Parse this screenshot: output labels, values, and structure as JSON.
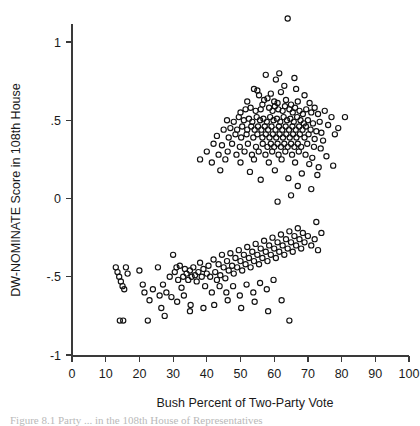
{
  "figure": {
    "caption": "Figure 8.1  Party  ...  in the 108th House of Representatives"
  },
  "chart_data": {
    "type": "scatter",
    "title": "",
    "xlabel": "Bush Percent of Two-Party Vote",
    "ylabel": "DW-NOMINATE Score in 108th House",
    "xlim": [
      0,
      100
    ],
    "ylim": [
      -1.25,
      1.25
    ],
    "xticks": [
      0,
      10,
      20,
      30,
      40,
      50,
      60,
      70,
      80,
      90,
      100
    ],
    "xticklabels": [
      "0",
      "10",
      "20",
      "30",
      "40",
      "50",
      "60",
      "70",
      "80",
      "90",
      "100"
    ],
    "yticks": [
      1,
      0.5,
      0,
      -0.5,
      -1
    ],
    "yticklabels": [
      "1",
      ".5",
      "0",
      "-.5",
      "-1"
    ],
    "grid": false,
    "legend": "none",
    "marker": "open-circle",
    "marker_color": "#111111",
    "marker_radius_px": 2.6,
    "series": [
      {
        "name": "House members",
        "points": [
          [
            64.0,
            1.15
          ],
          [
            57.5,
            0.79
          ],
          [
            60.5,
            0.76
          ],
          [
            61.5,
            0.8
          ],
          [
            66.0,
            0.77
          ],
          [
            63.0,
            0.72
          ],
          [
            54.0,
            0.7
          ],
          [
            55.0,
            0.69
          ],
          [
            55.5,
            0.66
          ],
          [
            59.0,
            0.67
          ],
          [
            62.0,
            0.68
          ],
          [
            66.5,
            0.7
          ],
          [
            69.0,
            0.66
          ],
          [
            52.0,
            0.62
          ],
          [
            57.0,
            0.63
          ],
          [
            58.0,
            0.64
          ],
          [
            60.0,
            0.62
          ],
          [
            61.0,
            0.61
          ],
          [
            63.5,
            0.63
          ],
          [
            65.0,
            0.6
          ],
          [
            67.0,
            0.62
          ],
          [
            70.5,
            0.61
          ],
          [
            72.0,
            0.58
          ],
          [
            50.0,
            0.55
          ],
          [
            51.5,
            0.57
          ],
          [
            53.0,
            0.58
          ],
          [
            54.5,
            0.56
          ],
          [
            56.0,
            0.57
          ],
          [
            56.5,
            0.6
          ],
          [
            58.5,
            0.58
          ],
          [
            59.5,
            0.56
          ],
          [
            60.2,
            0.59
          ],
          [
            61.2,
            0.57
          ],
          [
            62.5,
            0.56
          ],
          [
            63.2,
            0.59
          ],
          [
            64.5,
            0.57
          ],
          [
            65.5,
            0.55
          ],
          [
            66.2,
            0.58
          ],
          [
            67.5,
            0.56
          ],
          [
            68.5,
            0.54
          ],
          [
            69.5,
            0.57
          ],
          [
            71.0,
            0.55
          ],
          [
            73.0,
            0.54
          ],
          [
            75.0,
            0.56
          ],
          [
            77.0,
            0.52
          ],
          [
            81.0,
            0.52
          ],
          [
            46.0,
            0.5
          ],
          [
            48.0,
            0.49
          ],
          [
            49.5,
            0.52
          ],
          [
            51.0,
            0.5
          ],
          [
            52.5,
            0.51
          ],
          [
            53.5,
            0.49
          ],
          [
            54.8,
            0.52
          ],
          [
            55.8,
            0.5
          ],
          [
            56.8,
            0.51
          ],
          [
            57.8,
            0.49
          ],
          [
            58.8,
            0.52
          ],
          [
            59.8,
            0.5
          ],
          [
            60.8,
            0.51
          ],
          [
            61.8,
            0.49
          ],
          [
            62.8,
            0.52
          ],
          [
            63.8,
            0.5
          ],
          [
            64.8,
            0.51
          ],
          [
            65.8,
            0.49
          ],
          [
            66.8,
            0.52
          ],
          [
            67.8,
            0.5
          ],
          [
            68.8,
            0.48
          ],
          [
            70.0,
            0.5
          ],
          [
            71.5,
            0.48
          ],
          [
            73.5,
            0.49
          ],
          [
            76.0,
            0.47
          ],
          [
            79.0,
            0.45
          ],
          [
            45.0,
            0.44
          ],
          [
            47.0,
            0.45
          ],
          [
            49.0,
            0.44
          ],
          [
            50.5,
            0.46
          ],
          [
            52.0,
            0.44
          ],
          [
            53.2,
            0.46
          ],
          [
            54.2,
            0.44
          ],
          [
            55.2,
            0.46
          ],
          [
            56.2,
            0.44
          ],
          [
            57.2,
            0.46
          ],
          [
            58.2,
            0.44
          ],
          [
            59.2,
            0.46
          ],
          [
            60.4,
            0.44
          ],
          [
            61.4,
            0.46
          ],
          [
            62.4,
            0.44
          ],
          [
            63.4,
            0.46
          ],
          [
            64.4,
            0.44
          ],
          [
            65.4,
            0.46
          ],
          [
            66.4,
            0.44
          ],
          [
            67.4,
            0.46
          ],
          [
            68.4,
            0.44
          ],
          [
            69.4,
            0.46
          ],
          [
            70.8,
            0.44
          ],
          [
            72.5,
            0.43
          ],
          [
            74.0,
            0.42
          ],
          [
            78.0,
            0.41
          ],
          [
            43.0,
            0.4
          ],
          [
            46.5,
            0.39
          ],
          [
            48.5,
            0.41
          ],
          [
            50.2,
            0.39
          ],
          [
            51.8,
            0.41
          ],
          [
            53.8,
            0.39
          ],
          [
            55.0,
            0.41
          ],
          [
            56.5,
            0.39
          ],
          [
            57.5,
            0.41
          ],
          [
            58.6,
            0.39
          ],
          [
            59.6,
            0.41
          ],
          [
            60.6,
            0.39
          ],
          [
            61.6,
            0.41
          ],
          [
            62.6,
            0.39
          ],
          [
            63.6,
            0.41
          ],
          [
            64.6,
            0.39
          ],
          [
            65.6,
            0.41
          ],
          [
            66.6,
            0.39
          ],
          [
            67.6,
            0.41
          ],
          [
            69.0,
            0.39
          ],
          [
            70.2,
            0.41
          ],
          [
            72.0,
            0.38
          ],
          [
            74.5,
            0.37
          ],
          [
            42.0,
            0.35
          ],
          [
            44.5,
            0.34
          ],
          [
            47.5,
            0.35
          ],
          [
            49.8,
            0.33
          ],
          [
            52.2,
            0.35
          ],
          [
            54.6,
            0.33
          ],
          [
            56.6,
            0.35
          ],
          [
            58.0,
            0.33
          ],
          [
            59.0,
            0.35
          ],
          [
            60.0,
            0.33
          ],
          [
            61.0,
            0.35
          ],
          [
            62.0,
            0.33
          ],
          [
            63.0,
            0.35
          ],
          [
            64.0,
            0.33
          ],
          [
            65.0,
            0.35
          ],
          [
            66.0,
            0.33
          ],
          [
            67.0,
            0.35
          ],
          [
            68.0,
            0.33
          ],
          [
            69.8,
            0.35
          ],
          [
            71.8,
            0.33
          ],
          [
            73.8,
            0.32
          ],
          [
            40.0,
            0.3
          ],
          [
            43.5,
            0.28
          ],
          [
            46.2,
            0.3
          ],
          [
            48.8,
            0.28
          ],
          [
            51.2,
            0.3
          ],
          [
            53.4,
            0.28
          ],
          [
            55.4,
            0.3
          ],
          [
            57.4,
            0.28
          ],
          [
            59.4,
            0.3
          ],
          [
            61.3,
            0.28
          ],
          [
            63.3,
            0.3
          ],
          [
            65.3,
            0.28
          ],
          [
            67.3,
            0.3
          ],
          [
            69.3,
            0.28
          ],
          [
            71.3,
            0.26
          ],
          [
            75.5,
            0.27
          ],
          [
            38.0,
            0.25
          ],
          [
            41.5,
            0.23
          ],
          [
            45.5,
            0.25
          ],
          [
            50.0,
            0.23
          ],
          [
            54.0,
            0.25
          ],
          [
            58.4,
            0.23
          ],
          [
            62.2,
            0.25
          ],
          [
            66.2,
            0.23
          ],
          [
            70.4,
            0.22
          ],
          [
            73.2,
            0.2
          ],
          [
            77.5,
            0.21
          ],
          [
            44.0,
            0.18
          ],
          [
            52.8,
            0.17
          ],
          [
            60.2,
            0.18
          ],
          [
            68.2,
            0.16
          ],
          [
            72.8,
            0.15
          ],
          [
            56.0,
            0.12
          ],
          [
            64.2,
            0.13
          ],
          [
            67.0,
            0.08
          ],
          [
            71.0,
            0.06
          ],
          [
            65.0,
            0.02
          ],
          [
            61.0,
            -0.02
          ],
          [
            13.0,
            -0.44
          ],
          [
            13.5,
            -0.47
          ],
          [
            14.0,
            -0.5
          ],
          [
            14.5,
            -0.53
          ],
          [
            15.0,
            -0.56
          ],
          [
            15.5,
            -0.58
          ],
          [
            16.0,
            -0.44
          ],
          [
            16.5,
            -0.48
          ],
          [
            14.2,
            -0.78
          ],
          [
            15.2,
            -0.78
          ],
          [
            22.5,
            -0.78
          ],
          [
            20.0,
            -0.46
          ],
          [
            21.0,
            -0.55
          ],
          [
            21.5,
            -0.6
          ],
          [
            23.0,
            -0.65
          ],
          [
            25.5,
            -0.44
          ],
          [
            26.5,
            -0.7
          ],
          [
            27.0,
            -0.55
          ],
          [
            28.0,
            -0.6
          ],
          [
            29.0,
            -0.5
          ],
          [
            30.0,
            -0.36
          ],
          [
            30.5,
            -0.47
          ],
          [
            31.0,
            -0.44
          ],
          [
            31.5,
            -0.52
          ],
          [
            32.0,
            -0.43
          ],
          [
            32.5,
            -0.57
          ],
          [
            33.0,
            -0.5
          ],
          [
            33.5,
            -0.45
          ],
          [
            34.0,
            -0.48
          ],
          [
            34.5,
            -0.52
          ],
          [
            35.0,
            -0.46
          ],
          [
            35.5,
            -0.5
          ],
          [
            36.0,
            -0.44
          ],
          [
            36.5,
            -0.49
          ],
          [
            37.0,
            -0.53
          ],
          [
            37.5,
            -0.47
          ],
          [
            38.0,
            -0.41
          ],
          [
            38.5,
            -0.5
          ],
          [
            39.0,
            -0.45
          ],
          [
            39.5,
            -0.56
          ],
          [
            40.0,
            -0.48
          ],
          [
            40.5,
            -0.43
          ],
          [
            41.0,
            -0.5
          ],
          [
            29.5,
            -0.63
          ],
          [
            31.2,
            -0.66
          ],
          [
            33.2,
            -0.62
          ],
          [
            35.2,
            -0.68
          ],
          [
            26.0,
            -0.62
          ],
          [
            24.0,
            -0.58
          ],
          [
            42.0,
            -0.39
          ],
          [
            42.5,
            -0.47
          ],
          [
            43.0,
            -0.52
          ],
          [
            43.5,
            -0.42
          ],
          [
            44.0,
            -0.49
          ],
          [
            44.5,
            -0.36
          ],
          [
            45.0,
            -0.44
          ],
          [
            45.5,
            -0.51
          ],
          [
            46.0,
            -0.4
          ],
          [
            46.5,
            -0.46
          ],
          [
            47.0,
            -0.35
          ],
          [
            47.5,
            -0.43
          ],
          [
            48.0,
            -0.48
          ],
          [
            48.5,
            -0.38
          ],
          [
            49.0,
            -0.44
          ],
          [
            49.5,
            -0.33
          ],
          [
            50.0,
            -0.4
          ],
          [
            50.5,
            -0.46
          ],
          [
            51.0,
            -0.36
          ],
          [
            51.5,
            -0.42
          ],
          [
            52.0,
            -0.31
          ],
          [
            52.5,
            -0.38
          ],
          [
            53.0,
            -0.44
          ],
          [
            53.5,
            -0.34
          ],
          [
            54.0,
            -0.4
          ],
          [
            54.5,
            -0.29
          ],
          [
            55.0,
            -0.36
          ],
          [
            55.5,
            -0.42
          ],
          [
            56.0,
            -0.32
          ],
          [
            56.5,
            -0.38
          ],
          [
            57.0,
            -0.27
          ],
          [
            57.5,
            -0.34
          ],
          [
            58.0,
            -0.4
          ],
          [
            58.5,
            -0.3
          ],
          [
            59.0,
            -0.36
          ],
          [
            59.5,
            -0.25
          ],
          [
            60.0,
            -0.32
          ],
          [
            60.5,
            -0.38
          ],
          [
            61.0,
            -0.28
          ],
          [
            61.5,
            -0.34
          ],
          [
            62.0,
            -0.23
          ],
          [
            62.5,
            -0.3
          ],
          [
            63.0,
            -0.36
          ],
          [
            63.5,
            -0.26
          ],
          [
            64.0,
            -0.32
          ],
          [
            64.5,
            -0.21
          ],
          [
            65.0,
            -0.28
          ],
          [
            65.5,
            -0.34
          ],
          [
            66.0,
            -0.24
          ],
          [
            66.5,
            -0.3
          ],
          [
            67.0,
            -0.19
          ],
          [
            67.5,
            -0.26
          ],
          [
            68.0,
            -0.32
          ],
          [
            68.5,
            -0.22
          ],
          [
            69.0,
            -0.28
          ],
          [
            70.0,
            -0.24
          ],
          [
            71.0,
            -0.3
          ],
          [
            72.0,
            -0.26
          ],
          [
            73.0,
            -0.33
          ],
          [
            41.5,
            -0.6
          ],
          [
            43.8,
            -0.56
          ],
          [
            45.8,
            -0.6
          ],
          [
            47.8,
            -0.56
          ],
          [
            49.8,
            -0.62
          ],
          [
            51.8,
            -0.55
          ],
          [
            53.8,
            -0.6
          ],
          [
            55.8,
            -0.54
          ],
          [
            57.8,
            -0.58
          ],
          [
            59.8,
            -0.52
          ],
          [
            42.2,
            -0.68
          ],
          [
            46.2,
            -0.65
          ],
          [
            50.2,
            -0.7
          ],
          [
            54.2,
            -0.66
          ],
          [
            58.2,
            -0.72
          ],
          [
            62.2,
            -0.65
          ],
          [
            64.5,
            -0.78
          ],
          [
            35.0,
            -0.72
          ],
          [
            39.0,
            -0.7
          ],
          [
            27.5,
            -0.75
          ],
          [
            72.5,
            -0.15
          ],
          [
            74.0,
            -0.22
          ]
        ]
      }
    ]
  }
}
